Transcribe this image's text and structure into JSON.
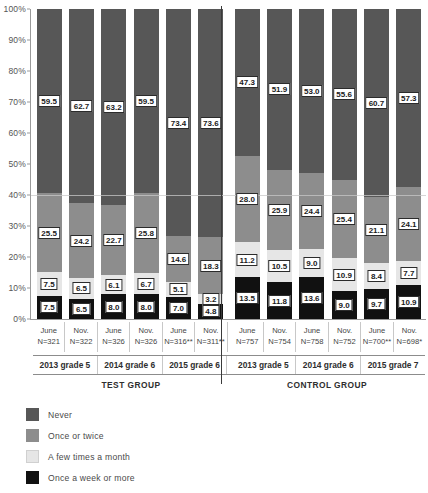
{
  "chart_data": {
    "type": "bar",
    "title": "",
    "subtype": "stacked-percentage",
    "xlabel": "",
    "ylabel": "",
    "ylim": [
      0,
      100
    ],
    "grid": true,
    "gridlines_at": [
      40
    ],
    "legend_position": "bottom-left",
    "y_ticks": [
      "0%",
      "10%",
      "20%",
      "30%",
      "40%",
      "50%",
      "60%",
      "70%",
      "80%",
      "90%",
      "100%"
    ],
    "categories": [
      "June N=321",
      "Nov. N=322",
      "June N=326",
      "Nov. N=326",
      "June N=316**",
      "Nov. N=311**",
      "June N=757",
      "Nov. N=754",
      "June N=758",
      "Nov. N=752",
      "June N=700**",
      "Nov. N=698*"
    ],
    "series": [
      {
        "name": "Never",
        "color": "#575757",
        "values": [
          59.5,
          62.7,
          63.2,
          59.5,
          73.4,
          73.6,
          47.3,
          51.9,
          53.0,
          55.6,
          60.7,
          57.3
        ]
      },
      {
        "name": "Once or twice",
        "color": "#8d8d8d",
        "values": [
          25.5,
          24.2,
          22.7,
          25.8,
          14.6,
          18.3,
          28.0,
          25.9,
          24.4,
          25.4,
          21.1,
          24.1
        ]
      },
      {
        "name": "A few times a month",
        "color": "#e6e6e6",
        "values": [
          7.5,
          6.5,
          6.1,
          6.7,
          5.1,
          3.2,
          11.2,
          10.5,
          9.0,
          10.9,
          8.4,
          7.7
        ]
      },
      {
        "name": "Once a week or more",
        "color": "#111111",
        "values": [
          7.5,
          6.5,
          8.0,
          8.0,
          7.0,
          4.8,
          13.5,
          11.8,
          13.6,
          9.0,
          9.7,
          10.9
        ]
      }
    ]
  },
  "axis": {
    "y_ticks": [
      {
        "label": "100%",
        "value": 100
      },
      {
        "label": "90%",
        "value": 90
      },
      {
        "label": "80%",
        "value": 80
      },
      {
        "label": "70%",
        "value": 70
      },
      {
        "label": "60%",
        "value": 60
      },
      {
        "label": "50%",
        "value": 50
      },
      {
        "label": "40%",
        "value": 40
      },
      {
        "label": "30%",
        "value": 30
      },
      {
        "label": "20%",
        "value": 20
      },
      {
        "label": "10%",
        "value": 10
      },
      {
        "label": "0%",
        "value": 0
      }
    ]
  },
  "x_axis": {
    "columns": [
      {
        "month": "June",
        "n": "N=321"
      },
      {
        "month": "Nov.",
        "n": "N=322"
      },
      {
        "month": "June",
        "n": "N=326"
      },
      {
        "month": "Nov.",
        "n": "N=326"
      },
      {
        "month": "June",
        "n": "N=316**"
      },
      {
        "month": "Nov.",
        "n": "N=311**"
      },
      {
        "month": "June",
        "n": "N=757"
      },
      {
        "month": "Nov.",
        "n": "N=754"
      },
      {
        "month": "June",
        "n": "N=758"
      },
      {
        "month": "Nov.",
        "n": "N=752"
      },
      {
        "month": "June",
        "n": "N=700**"
      },
      {
        "month": "Nov.",
        "n": "N=698*"
      }
    ],
    "groups": [
      {
        "label": "2013 grade 5"
      },
      {
        "label": "2014 grade 6"
      },
      {
        "label": "2015 grade 6"
      },
      {
        "label": "2013 grade 5"
      },
      {
        "label": "2014 grade 6"
      },
      {
        "label": "2015 grade 7"
      }
    ],
    "supergroups": [
      {
        "label": "TEST GROUP"
      },
      {
        "label": "CONTROL GROUP"
      }
    ]
  },
  "legend": {
    "items": [
      {
        "label": "Never",
        "color": "#575757"
      },
      {
        "label": "Once or twice",
        "color": "#8d8d8d"
      },
      {
        "label": "A few times a month",
        "color": "#e6e6e6"
      },
      {
        "label": "Once a week or more",
        "color": "#111111"
      }
    ]
  },
  "colors": {
    "never": "#575757",
    "once_or_twice": "#8d8d8d",
    "few_times_month": "#e6e6e6",
    "once_week_or_more": "#111111",
    "axis": "#9a9a9a",
    "divider": "#3a3a3a",
    "background": "#ffffff"
  }
}
